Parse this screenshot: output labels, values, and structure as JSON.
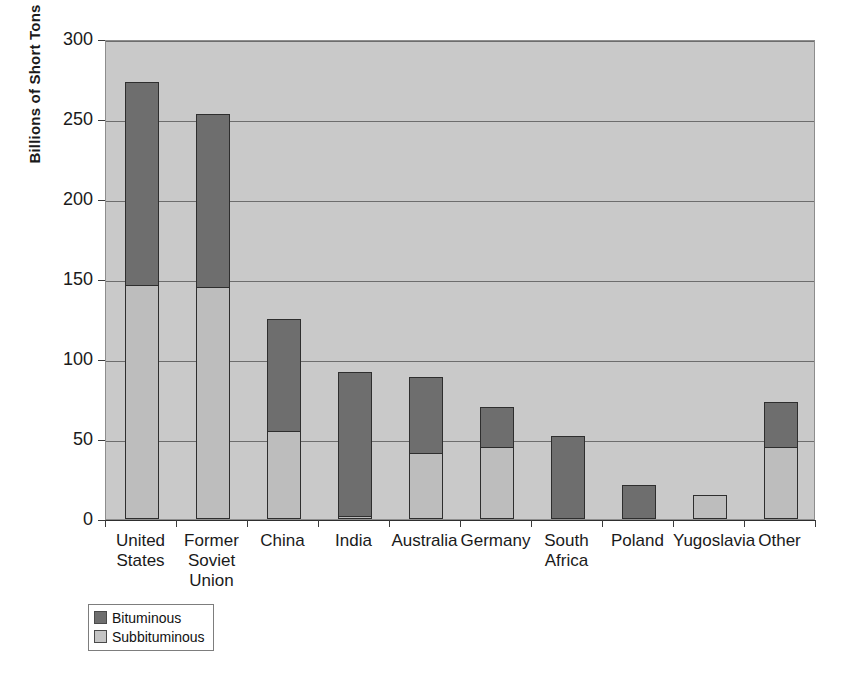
{
  "chart_data": {
    "type": "bar",
    "subtype": "stacked-vertical",
    "title": "",
    "xlabel": "",
    "ylabel": "Billions of Short Tons",
    "ylim": [
      0,
      300
    ],
    "yticks": [
      0,
      50,
      100,
      150,
      200,
      250,
      300
    ],
    "ytick_labels": [
      "0",
      "50",
      "100",
      "150",
      "200",
      "250",
      "300"
    ],
    "grid": true,
    "grid_axis": "y",
    "legend_position": "bottom-left",
    "categories": [
      "United States",
      "Former Soviet Union",
      "China",
      "India",
      "Australia",
      "Germany",
      "South Africa",
      "Poland",
      "Yugoslavia",
      "Other"
    ],
    "category_labels_multiline": [
      "United\nStates",
      "Former\nSoviet\nUnion",
      "China",
      "India",
      "Australia",
      "Germany",
      "South\nAfrica",
      "Poland",
      "Yugoslavia",
      "Other"
    ],
    "series": [
      {
        "name": "Subbituminous",
        "color": "#bdbdbd",
        "values": [
          146,
          145,
          55,
          2,
          41,
          45,
          0,
          0,
          15,
          45
        ]
      },
      {
        "name": "Bituminous",
        "color": "#6e6e6e",
        "values": [
          127,
          108,
          70,
          90,
          48,
          25,
          52,
          21,
          0,
          28
        ]
      }
    ],
    "totals": [
      273,
      253,
      125,
      92,
      89,
      70,
      52,
      21,
      15,
      73
    ],
    "stack_order": [
      "Subbituminous",
      "Bituminous"
    ]
  },
  "legend": {
    "items": [
      {
        "label": "Bituminous",
        "color": "#6e6e6e"
      },
      {
        "label": "Subbituminous",
        "color": "#c4c4c4"
      }
    ]
  },
  "colors": {
    "plot_background": "#c9c9c9",
    "page_background": "#ffffff",
    "gridline": "#6d6d6d",
    "axis": "#2e2e2e",
    "bar_outline": "#2e2e2e",
    "text": "#1a1a1a"
  }
}
